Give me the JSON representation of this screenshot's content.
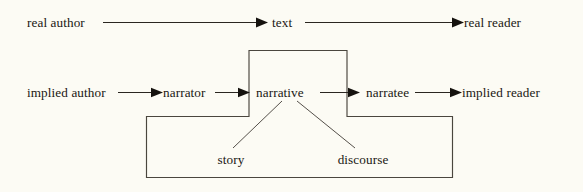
{
  "diagram": {
    "background_color": "#fcfbf4",
    "ink_color": "#1a1712",
    "rows": {
      "outer": {
        "name": "real communication level",
        "nodes": [
          {
            "id": "real-author",
            "label": "real author"
          },
          {
            "id": "text",
            "label": "text"
          },
          {
            "id": "real-reader",
            "label": "real reader"
          }
        ],
        "arrows": [
          {
            "from": "real author",
            "to": "text"
          },
          {
            "from": "text",
            "to": "real reader"
          }
        ]
      },
      "inner": {
        "name": "implied communication level",
        "nodes": [
          {
            "id": "implied-author",
            "label": "implied author"
          },
          {
            "id": "narrator",
            "label": "narrator"
          },
          {
            "id": "narrative",
            "label": "narrative"
          },
          {
            "id": "narratee",
            "label": "narratee"
          },
          {
            "id": "implied-reader",
            "label": "implied reader"
          }
        ],
        "arrows": [
          {
            "from": "implied author",
            "to": "narrator"
          },
          {
            "from": "narrator",
            "to": "narrative"
          },
          {
            "from": "narrative",
            "to": "narratee"
          },
          {
            "from": "narratee",
            "to": "implied reader"
          }
        ]
      },
      "components": {
        "name": "narrative components",
        "nodes": [
          {
            "id": "story",
            "label": "story"
          },
          {
            "id": "discourse",
            "label": "discourse"
          }
        ],
        "leaders": [
          {
            "from": "narrative",
            "to": "story"
          },
          {
            "from": "narrative",
            "to": "discourse"
          }
        ]
      }
    },
    "enclosure": {
      "name": "narrative-enclosure-outline",
      "shape": "cross",
      "description": "cross-shaped outline grouping narrative with story and discourse"
    }
  }
}
